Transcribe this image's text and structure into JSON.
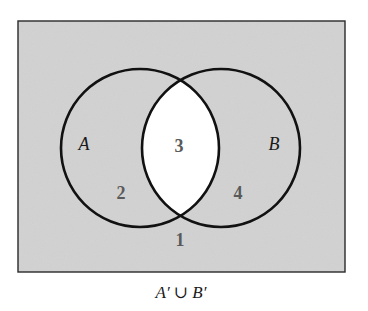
{
  "diagram": {
    "type": "venn",
    "shaded_region_description": "Everything except the intersection of A and B is shaded",
    "colors": {
      "shaded": "#d3d3d3",
      "unshaded": "#ffffff",
      "outline": "#111111",
      "region_number": "#5a5a5a"
    },
    "sets": [
      {
        "name": "A",
        "label": "A"
      },
      {
        "name": "B",
        "label": "B"
      }
    ],
    "regions": [
      {
        "number": "1",
        "description": "outside A and B",
        "shaded": true
      },
      {
        "number": "2",
        "description": "in A only",
        "shaded": true
      },
      {
        "number": "3",
        "description": "in A and B",
        "shaded": false
      },
      {
        "number": "4",
        "description": "in B only",
        "shaded": true
      }
    ],
    "caption": "A′ ∪ B′"
  }
}
